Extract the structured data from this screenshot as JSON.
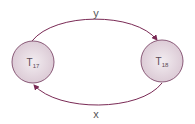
{
  "diagram": {
    "nodes": [
      {
        "id": "T17",
        "base": "T",
        "sub": "17"
      },
      {
        "id": "T18",
        "base": "T",
        "sub": "18"
      }
    ],
    "edges": [
      {
        "from": "T17",
        "to": "T18",
        "label": "y"
      },
      {
        "from": "T18",
        "to": "T17",
        "label": "x"
      }
    ],
    "colors": {
      "edge": "#7a2a55",
      "node_fill": "#e6dbe3",
      "node_stroke": "#8a5a78"
    }
  }
}
